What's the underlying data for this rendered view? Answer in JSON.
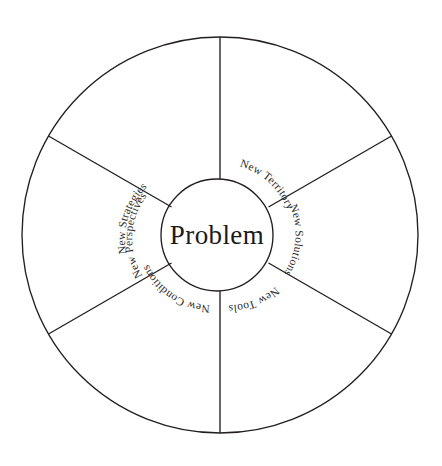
{
  "diagram": {
    "type": "radial-wheel",
    "title_center": "Problem",
    "segment_count": 6,
    "background_color": "#ffffff",
    "line_color": "#231f20",
    "text_color": "#2b2b2b",
    "geometry": {
      "outer_radius": 198,
      "inner_radius": 56,
      "center_x": 220,
      "center_y": 235
    },
    "segments": [
      {
        "label": "New Territory",
        "position": "upper-right",
        "start_angle_deg": 30,
        "end_angle_deg": 90
      },
      {
        "label": "New Solutions",
        "position": "right",
        "start_angle_deg": 330,
        "end_angle_deg": 30
      },
      {
        "label": "New Tools",
        "position": "lower-right",
        "start_angle_deg": 270,
        "end_angle_deg": 330
      },
      {
        "label": "New Conditions",
        "position": "lower-left",
        "start_angle_deg": 210,
        "end_angle_deg": 270
      },
      {
        "label": "New Perspectives",
        "position": "left",
        "start_angle_deg": 150,
        "end_angle_deg": 210
      },
      {
        "label": "New Strategies",
        "position": "upper-left",
        "start_angle_deg": 90,
        "end_angle_deg": 150
      }
    ]
  }
}
